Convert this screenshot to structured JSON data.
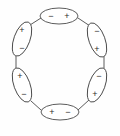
{
  "figure": {
    "type": "dipole-ring-diagram",
    "background_color": "#fefefe",
    "stroke_color": "#4a4a4a",
    "label_color": "#2b2b2b",
    "ring": {
      "center_x": 60,
      "center_y": 65,
      "radius": 44,
      "count": 6
    },
    "dipoles": [
      {
        "id": "dipole-top",
        "position": "top",
        "cx": 59,
        "cy": 16,
        "rx": 19,
        "ry": 8,
        "rotation": 0,
        "first_label": "−",
        "second_label": "+",
        "first_offset_x": -8,
        "first_offset_y": 0,
        "second_offset_x": 8,
        "second_offset_y": 0
      },
      {
        "id": "dipole-upper-right",
        "position": "upper-right",
        "cx": 97,
        "cy": 40,
        "rx": 18,
        "ry": 8,
        "rotation": 70,
        "first_label": "−",
        "second_label": "+",
        "first_offset_x": 0,
        "first_offset_y": -9,
        "second_offset_x": 0,
        "second_offset_y": 9
      },
      {
        "id": "dipole-lower-right",
        "position": "lower-right",
        "cx": 97,
        "cy": 85,
        "rx": 18,
        "ry": 8,
        "rotation": 110,
        "first_label": "−",
        "second_label": "+",
        "first_offset_x": 2,
        "first_offset_y": -9,
        "second_offset_x": -2,
        "second_offset_y": 9
      },
      {
        "id": "dipole-bottom",
        "position": "bottom",
        "cx": 60,
        "cy": 112,
        "rx": 19,
        "ry": 8,
        "rotation": 0,
        "first_label": "+",
        "second_label": "−",
        "first_offset_x": -8,
        "first_offset_y": 0,
        "second_offset_x": 8,
        "second_offset_y": 0
      },
      {
        "id": "dipole-lower-left",
        "position": "lower-left",
        "cx": 22,
        "cy": 85,
        "rx": 18,
        "ry": 8,
        "rotation": 70,
        "first_label": "+",
        "second_label": "−",
        "first_offset_x": -2,
        "first_offset_y": -9,
        "second_offset_x": 2,
        "second_offset_y": 9
      },
      {
        "id": "dipole-upper-left",
        "position": "upper-left",
        "cx": 22,
        "cy": 39,
        "rx": 18,
        "ry": 8,
        "rotation": 110,
        "first_label": "+",
        "second_label": "−",
        "first_offset_x": 0,
        "first_offset_y": -9,
        "second_offset_x": 0,
        "second_offset_y": 9
      }
    ],
    "connectors": [
      {
        "id": "connector-top-to-upper-right",
        "x1": 78,
        "y1": 18,
        "x2": 90,
        "y2": 26
      },
      {
        "id": "connector-upper-right-to-lower-right",
        "x1": 104,
        "y1": 56,
        "x2": 104,
        "y2": 69
      },
      {
        "id": "connector-lower-right-to-bottom",
        "x1": 89,
        "y1": 100,
        "x2": 78,
        "y2": 110
      },
      {
        "id": "connector-bottom-to-lower-left",
        "x1": 41,
        "y1": 110,
        "x2": 31,
        "y2": 101
      },
      {
        "id": "connector-lower-left-to-upper-left",
        "x1": 16,
        "y1": 69,
        "x2": 16,
        "y2": 56
      },
      {
        "id": "connector-upper-left-to-top",
        "x1": 30,
        "y1": 25,
        "x2": 41,
        "y2": 18
      }
    ]
  }
}
